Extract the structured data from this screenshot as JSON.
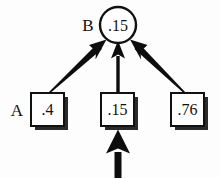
{
  "diagram": {
    "background_color": "#fdfdfd",
    "ink_color": "#0d0d0d",
    "shadow_color": "#2b2b2b",
    "labels": {
      "top_label": "B",
      "bottom_label": "A"
    },
    "nodes": {
      "top_circle": {
        "shape": "circle",
        "value": ".15",
        "label": "B",
        "cx": 118,
        "cy": 25,
        "r": 18
      },
      "boxes": [
        {
          "id": "box-left",
          "shape": "square",
          "value": ".4",
          "label": "A",
          "x": 31,
          "y": 93,
          "size": 33
        },
        {
          "id": "box-middle",
          "shape": "square",
          "value": ".15",
          "label": "",
          "x": 101,
          "y": 93,
          "size": 33
        },
        {
          "id": "box-right",
          "shape": "square",
          "value": ".76",
          "label": "",
          "x": 171,
          "y": 93,
          "size": 33
        }
      ]
    },
    "edges": [
      {
        "id": "edge-left-to-circle",
        "from": "box-left",
        "to": "top-circle",
        "direction": "up-right",
        "style": "thick-tapered-arrow"
      },
      {
        "id": "edge-middle-to-circle",
        "from": "box-middle",
        "to": "top-circle",
        "direction": "up",
        "style": "thin-shaft-arrow"
      },
      {
        "id": "edge-right-to-circle",
        "from": "box-right",
        "to": "top-circle",
        "direction": "up-left",
        "style": "thick-tapered-arrow"
      },
      {
        "id": "edge-input-to-middle",
        "from": "external-input",
        "to": "box-middle",
        "direction": "up",
        "style": "thick-block-arrow"
      }
    ]
  }
}
